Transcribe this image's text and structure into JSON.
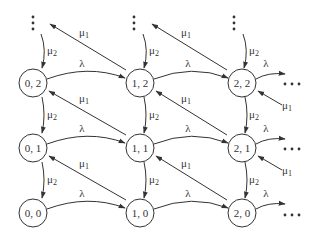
{
  "diagram": {
    "type": "state-transition-diagram",
    "nodes": [
      {
        "id": "0,2",
        "label": "0, 2",
        "x": 33,
        "y": 83
      },
      {
        "id": "1,2",
        "label": "1, 2",
        "x": 140,
        "y": 83
      },
      {
        "id": "2,2",
        "label": "2, 2",
        "x": 242,
        "y": 83
      },
      {
        "id": "0,1",
        "label": "0, 1",
        "x": 33,
        "y": 148
      },
      {
        "id": "1,1",
        "label": "1, 1",
        "x": 140,
        "y": 148
      },
      {
        "id": "2,1",
        "label": "2, 1",
        "x": 242,
        "y": 148
      },
      {
        "id": "0,0",
        "label": "0, 0",
        "x": 33,
        "y": 213
      },
      {
        "id": "1,0",
        "label": "1, 0",
        "x": 140,
        "y": 213
      },
      {
        "id": "2,0",
        "label": "2, 0",
        "x": 242,
        "y": 213
      }
    ],
    "labels": {
      "lambda": "λ",
      "mu": "μ",
      "mu1_sub": "1",
      "mu2_sub": "2",
      "hdots": "···",
      "vdots": "⋮"
    },
    "edges": [
      {
        "from": "0,2",
        "to": "1,2",
        "label": "λ"
      },
      {
        "from": "1,2",
        "to": "2,2",
        "label": "λ"
      },
      {
        "from": "2,2",
        "to": "…",
        "label": "λ"
      },
      {
        "from": "0,1",
        "to": "1,1",
        "label": "λ"
      },
      {
        "from": "1,1",
        "to": "2,1",
        "label": "λ"
      },
      {
        "from": "2,1",
        "to": "…",
        "label": "λ"
      },
      {
        "from": "0,0",
        "to": "1,0",
        "label": "λ"
      },
      {
        "from": "1,0",
        "to": "2,0",
        "label": "λ"
      },
      {
        "from": "2,0",
        "to": "…",
        "label": "λ"
      },
      {
        "from": "⋮",
        "to": "0,2",
        "label": "μ2"
      },
      {
        "from": "⋮",
        "to": "1,2",
        "label": "μ2"
      },
      {
        "from": "⋮",
        "to": "2,2",
        "label": "μ2"
      },
      {
        "from": "0,2",
        "to": "0,1",
        "label": "μ2"
      },
      {
        "from": "1,2",
        "to": "1,1",
        "label": "μ2"
      },
      {
        "from": "2,2",
        "to": "2,1",
        "label": "μ2"
      },
      {
        "from": "0,1",
        "to": "0,0",
        "label": "μ2"
      },
      {
        "from": "1,1",
        "to": "1,0",
        "label": "μ2"
      },
      {
        "from": "2,1",
        "to": "2,0",
        "label": "μ2"
      },
      {
        "from": "1,2",
        "to": "⋮",
        "label": "μ1"
      },
      {
        "from": "2,2",
        "to": "⋮",
        "label": "μ1"
      },
      {
        "from": "1,1",
        "to": "0,2",
        "label": "μ1"
      },
      {
        "from": "2,1",
        "to": "1,2",
        "label": "μ1"
      },
      {
        "from": "…",
        "to": "2,2",
        "label": "μ1"
      },
      {
        "from": "1,0",
        "to": "0,1",
        "label": "μ1"
      },
      {
        "from": "2,0",
        "to": "1,1",
        "label": "μ1"
      },
      {
        "from": "…",
        "to": "2,1",
        "label": "μ1"
      }
    ]
  }
}
